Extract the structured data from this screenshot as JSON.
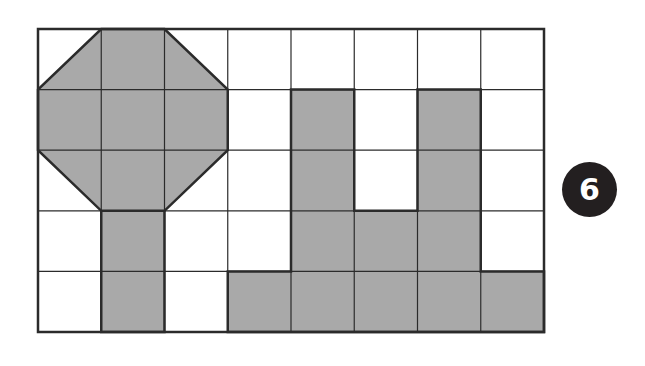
{
  "figure": {
    "badge_number": "6",
    "grid": {
      "columns": 8,
      "rows": 5,
      "left": 38,
      "top": 29,
      "right": 544,
      "bottom": 332
    },
    "colors": {
      "shade": "#a9a9a9",
      "line": "#2b2b2b",
      "badge": "#231f20",
      "background": "#ffffff"
    },
    "shapes": {
      "octagon": {
        "description": "Octagon covering the 3x3 block at columns 0-2, rows 0-2, with corner cells cut diagonally",
        "vertices_grid": [
          [
            1,
            0
          ],
          [
            2,
            0
          ],
          [
            3,
            1
          ],
          [
            3,
            2
          ],
          [
            2,
            3
          ],
          [
            1,
            3
          ],
          [
            0,
            2
          ],
          [
            0,
            1
          ]
        ]
      },
      "stem_cells": [
        [
          3,
          1
        ],
        [
          4,
          1
        ]
      ],
      "right_shape_cells": [
        [
          1,
          4
        ],
        [
          2,
          4
        ],
        [
          1,
          6
        ],
        [
          2,
          6
        ],
        [
          3,
          4
        ],
        [
          3,
          5
        ],
        [
          3,
          6
        ],
        [
          4,
          3
        ],
        [
          4,
          4
        ],
        [
          4,
          5
        ],
        [
          4,
          6
        ],
        [
          4,
          7
        ]
      ]
    }
  }
}
